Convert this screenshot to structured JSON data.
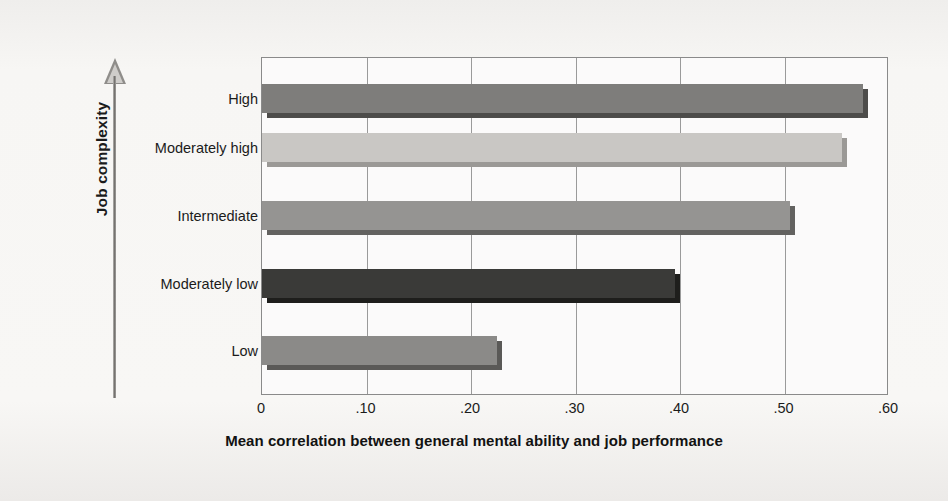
{
  "chart_data": {
    "type": "bar",
    "orientation": "horizontal",
    "title": "",
    "xlabel": "Mean correlation between general mental ability and job performance",
    "ylabel": "Job complexity",
    "categories": [
      "High",
      "Moderately high",
      "Intermediate",
      "Moderately low",
      "Low"
    ],
    "values": [
      0.58,
      0.56,
      0.51,
      0.4,
      0.23
    ],
    "value_labels": [
      ".58",
      ".56",
      ".51",
      ".40",
      ".23"
    ],
    "xlim": [
      0,
      0.6
    ],
    "xticks": [
      0,
      0.1,
      0.2,
      0.3,
      0.4,
      0.5,
      0.6
    ],
    "xtick_labels": [
      "0",
      ".10",
      ".20",
      ".30",
      ".40",
      ".50",
      ".60"
    ],
    "grid": "vertical",
    "legend": "none",
    "bar_colors": [
      "#7e7d7b",
      "#c9c7c4",
      "#959492",
      "#3a3a38",
      "#8b8a88"
    ],
    "bar_shadow_colors": [
      "#4d4c4a",
      "#9b9996",
      "#636260",
      "#1e1e1c",
      "#5a5957"
    ],
    "background_color": "#f6f5f3",
    "axis_color": "#8a8a8a",
    "text_color": "#1b1b1b"
  },
  "axes": {
    "y_axis_arrow": "up-arrow-icon",
    "y_axis_title": "Job complexity",
    "x_axis_title": "Mean correlation between general mental ability and job performance"
  }
}
